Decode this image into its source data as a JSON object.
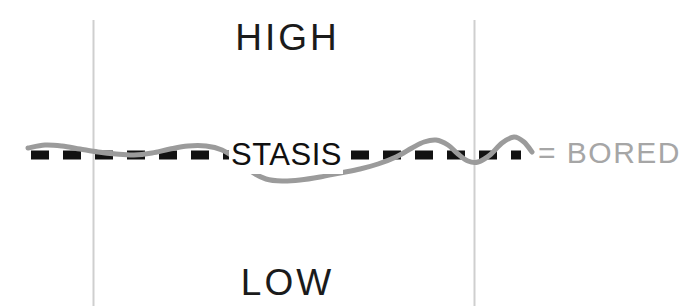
{
  "figure": {
    "type": "line-chart-annotation",
    "width": 685,
    "height": 308,
    "background_color": "#ffffff"
  },
  "labels": {
    "high": "HIGH",
    "stasis": "STASIS",
    "low": "LOW",
    "legend": "= BORED"
  },
  "colors": {
    "line_dark": "#121212",
    "curve_gray": "#9b9b9b",
    "legend_gray": "#a6a6a6",
    "gridline_gray": "#cfcfcf",
    "text_dark": "#1b1b1b"
  },
  "chart_data": {
    "type": "line",
    "title": "",
    "xlabel": "",
    "ylabel": "",
    "grid": true,
    "legend_position": "right",
    "xlim": [
      0,
      685
    ],
    "ylim": [
      308,
      0
    ],
    "y_reference_lines": [
      {
        "name": "HIGH",
        "y": 64,
        "style": "solid-thick-rough",
        "color": "#121212",
        "x_start": 31,
        "x_end": 542
      },
      {
        "name": "STASIS",
        "y": 155,
        "style": "dashed-thick",
        "color": "#121212",
        "x_start": 31,
        "x_end": 520,
        "dash": 17,
        "gap": 14
      },
      {
        "name": "LOW",
        "y": 260,
        "style": "solid-thick-rough",
        "color": "#121212",
        "x_start": 31,
        "x_end": 542
      }
    ],
    "x_gridlines": [
      {
        "x": 93,
        "color": "#cfcfcf",
        "y_start": 20,
        "y_end": 305
      },
      {
        "x": 474,
        "color": "#cfcfcf",
        "y_start": 20,
        "y_end": 305
      }
    ],
    "series": [
      {
        "name": "BORED",
        "color": "#9b9b9b",
        "width": 5,
        "x": [
          28,
          45,
          62,
          80,
          98,
          116,
          134,
          152,
          170,
          188,
          206,
          222,
          238,
          252,
          266,
          282,
          300,
          320,
          340,
          360,
          378,
          396,
          412,
          424,
          436,
          448,
          458,
          468,
          478,
          490,
          502,
          514,
          524,
          532
        ],
        "y": [
          148,
          145,
          146,
          149,
          152,
          154,
          155,
          153,
          149,
          146,
          146,
          150,
          160,
          172,
          179,
          181,
          180,
          177,
          173,
          169,
          164,
          157,
          148,
          142,
          140,
          145,
          154,
          161,
          162,
          155,
          143,
          137,
          142,
          152
        ]
      }
    ],
    "annotations": [
      {
        "text": "HIGH",
        "x": 293,
        "y": 42,
        "color": "#1b1b1b"
      },
      {
        "text": "STASIS",
        "x": 286,
        "y": 155,
        "color": "#101010"
      },
      {
        "text": "LOW",
        "x": 293,
        "y": 285,
        "color": "#1b1b1b"
      },
      {
        "text": "= BORED",
        "x": 604,
        "y": 155,
        "color": "#a6a6a6"
      }
    ]
  }
}
